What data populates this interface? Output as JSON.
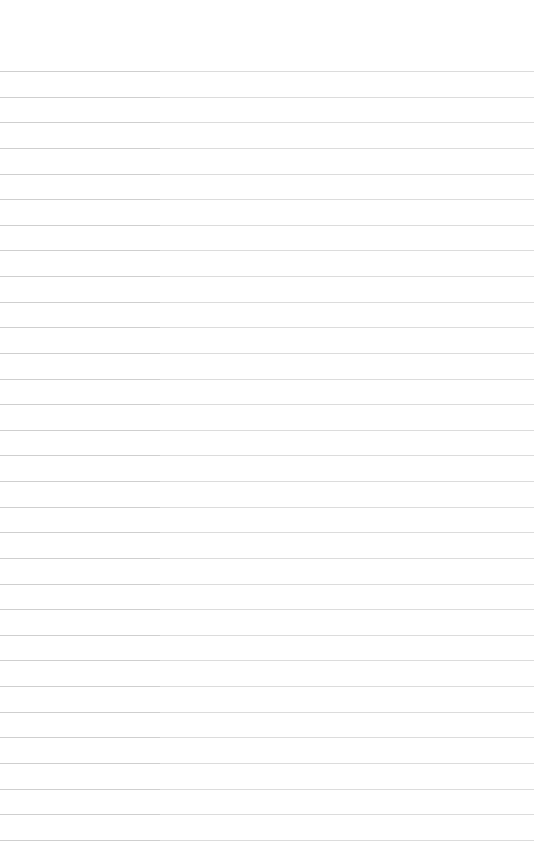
{
  "page": {
    "type": "blank ruled sheet",
    "line_count": 31,
    "first_line_y": 71,
    "line_spacing": 25.63,
    "line_color": "#d4d4d4",
    "background": "#ffffff"
  }
}
